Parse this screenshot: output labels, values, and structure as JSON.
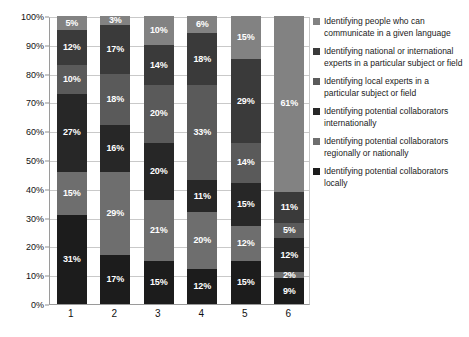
{
  "chart_data": {
    "type": "bar",
    "subtype": "100% stacked bar",
    "title": "",
    "xlabel": "",
    "ylabel": "",
    "categories": [
      "1",
      "2",
      "3",
      "4",
      "5",
      "6"
    ],
    "ylim": [
      0,
      100
    ],
    "ytick_labels": [
      "0%",
      "10%",
      "20%",
      "30%",
      "40%",
      "50%",
      "60%",
      "70%",
      "80%",
      "90%",
      "100%"
    ],
    "ytick_values": [
      0,
      10,
      20,
      30,
      40,
      50,
      60,
      70,
      80,
      90,
      100
    ],
    "grid": true,
    "grid_axis": "y",
    "legend_position": "right",
    "value_format": "percent",
    "stack_order": "bottom-to-top",
    "series": [
      {
        "name": "Identifying potential collaborators locally",
        "color": "#1c1c1c",
        "values": [
          31,
          17,
          15,
          12,
          15,
          9
        ],
        "labels": [
          "31%",
          "17%",
          "15%",
          "12%",
          "15%",
          "9%"
        ]
      },
      {
        "name": "Identifying potential collaborators regionally or nationally",
        "color": "#6e6e6e",
        "values": [
          15,
          29,
          21,
          20,
          12,
          2
        ],
        "labels": [
          "15%",
          "29%",
          "21%",
          "20%",
          "12%",
          "2%"
        ]
      },
      {
        "name": "Identifying potential collaborators internationally",
        "color": "#272727",
        "values": [
          27,
          16,
          20,
          11,
          15,
          12
        ],
        "labels": [
          "27%",
          "16%",
          "20%",
          "11%",
          "15%",
          "12%"
        ]
      },
      {
        "name": "Identifying local experts in a particular subject or field",
        "color": "#5a5a5a",
        "values": [
          10,
          18,
          20,
          33,
          14,
          5
        ],
        "labels": [
          "10%",
          "18%",
          "20%",
          "33%",
          "14%",
          "5%"
        ]
      },
      {
        "name": "Identifying national or international experts in a particular subject or field",
        "color": "#3a3a3a",
        "values": [
          12,
          17,
          14,
          18,
          29,
          11
        ],
        "labels": [
          "12%",
          "17%",
          "14%",
          "18%",
          "29%",
          "11%"
        ]
      },
      {
        "name": "Identifying people who can communicate in a given language",
        "color": "#828282",
        "values": [
          5,
          3,
          10,
          6,
          15,
          61
        ],
        "labels": [
          "5%",
          "3%",
          "10%",
          "6%",
          "15%",
          "61%"
        ]
      }
    ]
  },
  "legend": {
    "items": [
      {
        "label": "Identifying people who can communicate in a given language",
        "color": "#828282"
      },
      {
        "label": "Identifying national or international experts in a particular subject or field",
        "color": "#3a3a3a"
      },
      {
        "label": "Identifying local experts in a particular subject or field",
        "color": "#5a5a5a"
      },
      {
        "label": "Identifying potential collaborators internationally",
        "color": "#272727"
      },
      {
        "label": "Identifying potential collaborators regionally or nationally",
        "color": "#6e6e6e"
      },
      {
        "label": "Identifying potential collaborators locally",
        "color": "#1c1c1c"
      }
    ]
  }
}
